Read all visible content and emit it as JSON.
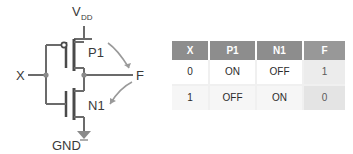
{
  "diagram": {
    "type": "cmos-inverter-schematic",
    "labels": {
      "supply": "V",
      "supply_subscript": "DD",
      "ground": "GND",
      "input": "X",
      "output": "F",
      "pmos": "P1",
      "nmos": "N1"
    },
    "colors": {
      "wire": "#6b6b6b",
      "device": "#4a4a4a",
      "annotation_arrow": "#9a9a9a",
      "text": "#3a3a3a",
      "table_header_bg": "#8d8d8d",
      "table_header_text": "#ffffff",
      "table_f_column_bg": "#ececec",
      "table_row_divider": "#f0f0f0"
    },
    "annotations": [
      {
        "name": "pmos-to-output-arrow",
        "from": "P1",
        "to": "F"
      },
      {
        "name": "nmos-to-output-arrow",
        "from": "N1",
        "to": "F"
      }
    ]
  },
  "table": {
    "headers": [
      "X",
      "P1",
      "N1",
      "F"
    ],
    "rows": [
      [
        "0",
        "ON",
        "OFF",
        "1"
      ],
      [
        "1",
        "OFF",
        "ON",
        "0"
      ]
    ]
  }
}
